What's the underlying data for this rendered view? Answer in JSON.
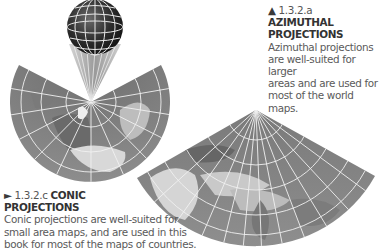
{
  "captions": {
    "azimuthal": {
      "marker": "▲",
      "number": "1.3.2.a",
      "title_line1": "AZIMUTHAL",
      "title_line2": "PROJECTIONS",
      "body": [
        "Azimuthal projections",
        "are well-suited for larger",
        "areas and are used for",
        "most of the world maps."
      ]
    },
    "conic": {
      "marker": "►",
      "number": "1.3.2.c",
      "title_line1": "CONIC",
      "title_line2": "PROJECTIONS",
      "body": [
        "Conic projections are well-suited for",
        "small area maps, and are used in this",
        "book for most of the maps of countries."
      ]
    }
  },
  "figures": {
    "globe": {
      "label": "globe-with-graticule",
      "cx": 95,
      "cy": 27,
      "r": 28
    },
    "azimuthal_map": {
      "label": "azimuthal-projection-map",
      "cx": 91,
      "cy": 102,
      "r": 79
    },
    "conic_map": {
      "label": "conic-projection-map",
      "apex_x": 256,
      "apex_y": 110
    }
  },
  "colors": {
    "map_fill": "#8a8a8a",
    "graticule": "#f2f2f2",
    "globe_fill": "#2b2b2b",
    "text": "#4a4a4a"
  }
}
